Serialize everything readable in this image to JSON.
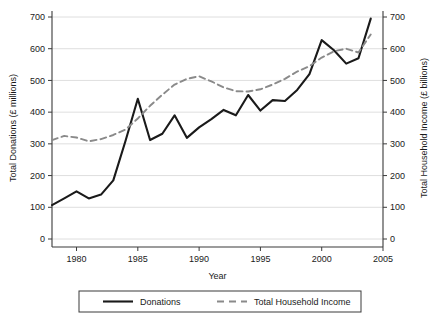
{
  "chart_data": {
    "type": "line",
    "title": "",
    "xlabel": "Year",
    "ylabel": "Total Donations (£ millions)",
    "y2label": "Total Household Income (£ billions)",
    "xlim": [
      1978,
      2005
    ],
    "ylim": [
      0,
      700
    ],
    "y2lim": [
      0,
      700
    ],
    "grid": true,
    "legend_position": "bottom",
    "xticks": [
      "1980",
      "1985",
      "1990",
      "1995",
      "2000",
      "2005"
    ],
    "xtick_values": [
      1980,
      1985,
      1990,
      1995,
      2000,
      2005
    ],
    "yticks": [
      "0",
      "100",
      "200",
      "300",
      "400",
      "500",
      "600",
      "700"
    ],
    "ytick_values": [
      0,
      100,
      200,
      300,
      400,
      500,
      600,
      700
    ],
    "y2ticks": [
      "0",
      "100",
      "200",
      "300",
      "400",
      "500",
      "600",
      "700"
    ],
    "y2tick_values": [
      0,
      100,
      200,
      300,
      400,
      500,
      600,
      700
    ],
    "x": [
      1978,
      1979,
      1980,
      1981,
      1982,
      1983,
      1984,
      1985,
      1986,
      1987,
      1988,
      1989,
      1990,
      1991,
      1992,
      1993,
      1994,
      1995,
      1996,
      1997,
      1998,
      1999,
      2000,
      2001,
      2002,
      2003,
      2004
    ],
    "series": [
      {
        "name": "Donations",
        "axis": "left",
        "style": "solid",
        "color": "#1a1a1a",
        "values": [
          107,
          128,
          150,
          128,
          140,
          185,
          310,
          442,
          312,
          332,
          390,
          319,
          352,
          378,
          407,
          390,
          454,
          405,
          438,
          435,
          470,
          520,
          627,
          595,
          553,
          570,
          695
        ]
      },
      {
        "name": "Total Household Income",
        "axis": "right",
        "style": "dashed",
        "color": "#8a8a8a",
        "values": [
          312,
          325,
          320,
          308,
          315,
          328,
          345,
          380,
          420,
          455,
          487,
          505,
          513,
          497,
          478,
          466,
          465,
          472,
          487,
          505,
          528,
          545,
          572,
          592,
          600,
          588,
          645
        ]
      }
    ]
  },
  "legend": {
    "items": [
      {
        "label": "Donations",
        "style": "solid",
        "color": "#1a1a1a"
      },
      {
        "label": "Total Household Income",
        "style": "dashed",
        "color": "#8a8a8a"
      }
    ]
  },
  "colors": {
    "donations_line": "#1a1a1a",
    "income_line": "#8a8a8a",
    "gridline": "#d5d5d5",
    "axis": "#3a3a3a",
    "background": "#ffffff"
  }
}
